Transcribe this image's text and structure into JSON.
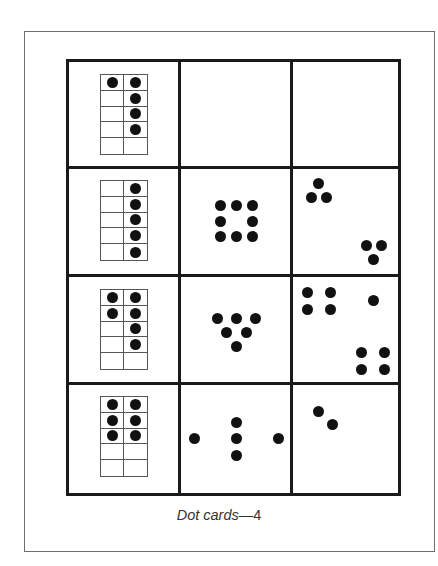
{
  "title": "Dot cards—4",
  "caption": {
    "text": "Dot cards",
    "dash": "—",
    "number": "4"
  },
  "grid": {
    "rows": 4,
    "columns": 3,
    "cells": [
      {
        "row": 1,
        "col": 1,
        "type": "ten-frame",
        "filled": [
          true,
          true,
          false,
          true,
          false,
          true,
          false,
          true,
          false,
          false
        ],
        "count": 5
      },
      {
        "row": 1,
        "col": 2,
        "type": "empty",
        "count": 0
      },
      {
        "row": 1,
        "col": 3,
        "type": "empty",
        "count": 0
      },
      {
        "row": 2,
        "col": 1,
        "type": "ten-frame",
        "filled": [
          false,
          true,
          false,
          true,
          false,
          true,
          false,
          true,
          false,
          true
        ],
        "count": 5
      },
      {
        "row": 2,
        "col": 2,
        "type": "dots",
        "arrangement": "ring-of-eight",
        "count": 8,
        "dots": [
          [
            220,
            205
          ],
          [
            236,
            205
          ],
          [
            252,
            205
          ],
          [
            220,
            221
          ],
          [
            252,
            221
          ],
          [
            220,
            236
          ],
          [
            236,
            236
          ],
          [
            252,
            236
          ]
        ]
      },
      {
        "row": 2,
        "col": 3,
        "type": "dots",
        "arrangement": "two-triangles",
        "count": 6,
        "dots": [
          [
            318,
            183
          ],
          [
            311,
            197
          ],
          [
            326,
            197
          ],
          [
            366,
            245
          ],
          [
            381,
            245
          ],
          [
            373,
            259
          ]
        ]
      },
      {
        "row": 3,
        "col": 1,
        "type": "ten-frame",
        "filled": [
          true,
          true,
          true,
          true,
          false,
          true,
          false,
          true,
          false,
          false
        ],
        "count": 6
      },
      {
        "row": 3,
        "col": 2,
        "type": "dots",
        "arrangement": "inverted-triangle",
        "count": 6,
        "dots": [
          [
            217,
            318
          ],
          [
            236,
            318
          ],
          [
            255,
            318
          ],
          [
            226,
            332
          ],
          [
            246,
            332
          ],
          [
            236,
            346
          ]
        ]
      },
      {
        "row": 3,
        "col": 3,
        "type": "dots",
        "arrangement": "four-one-four",
        "count": 9,
        "dots": [
          [
            307,
            292
          ],
          [
            330,
            292
          ],
          [
            307,
            309
          ],
          [
            330,
            309
          ],
          [
            373,
            300
          ],
          [
            361,
            352
          ],
          [
            384,
            352
          ],
          [
            361,
            369
          ],
          [
            384,
            369
          ]
        ]
      },
      {
        "row": 4,
        "col": 1,
        "type": "ten-frame",
        "filled": [
          true,
          true,
          true,
          true,
          true,
          true,
          false,
          false,
          false,
          false
        ],
        "count": 6
      },
      {
        "row": 4,
        "col": 2,
        "type": "dots",
        "arrangement": "cross",
        "count": 5,
        "dots": [
          [
            194,
            438
          ],
          [
            236,
            422
          ],
          [
            236,
            438
          ],
          [
            236,
            455
          ],
          [
            278,
            438
          ]
        ]
      },
      {
        "row": 4,
        "col": 3,
        "type": "dots",
        "arrangement": "diagonal-pair",
        "count": 2,
        "dots": [
          [
            318,
            411
          ],
          [
            332,
            424
          ]
        ]
      }
    ]
  },
  "ten_frames": [
    {
      "left": 100,
      "top": 74
    },
    {
      "left": 100,
      "top": 180
    },
    {
      "left": 100,
      "top": 289
    },
    {
      "left": 100,
      "top": 396
    }
  ],
  "colors": {
    "ink": "#111111",
    "grid_line": "#1a1a1a",
    "frame_line": "#6e6e6e",
    "background": "#ffffff"
  }
}
